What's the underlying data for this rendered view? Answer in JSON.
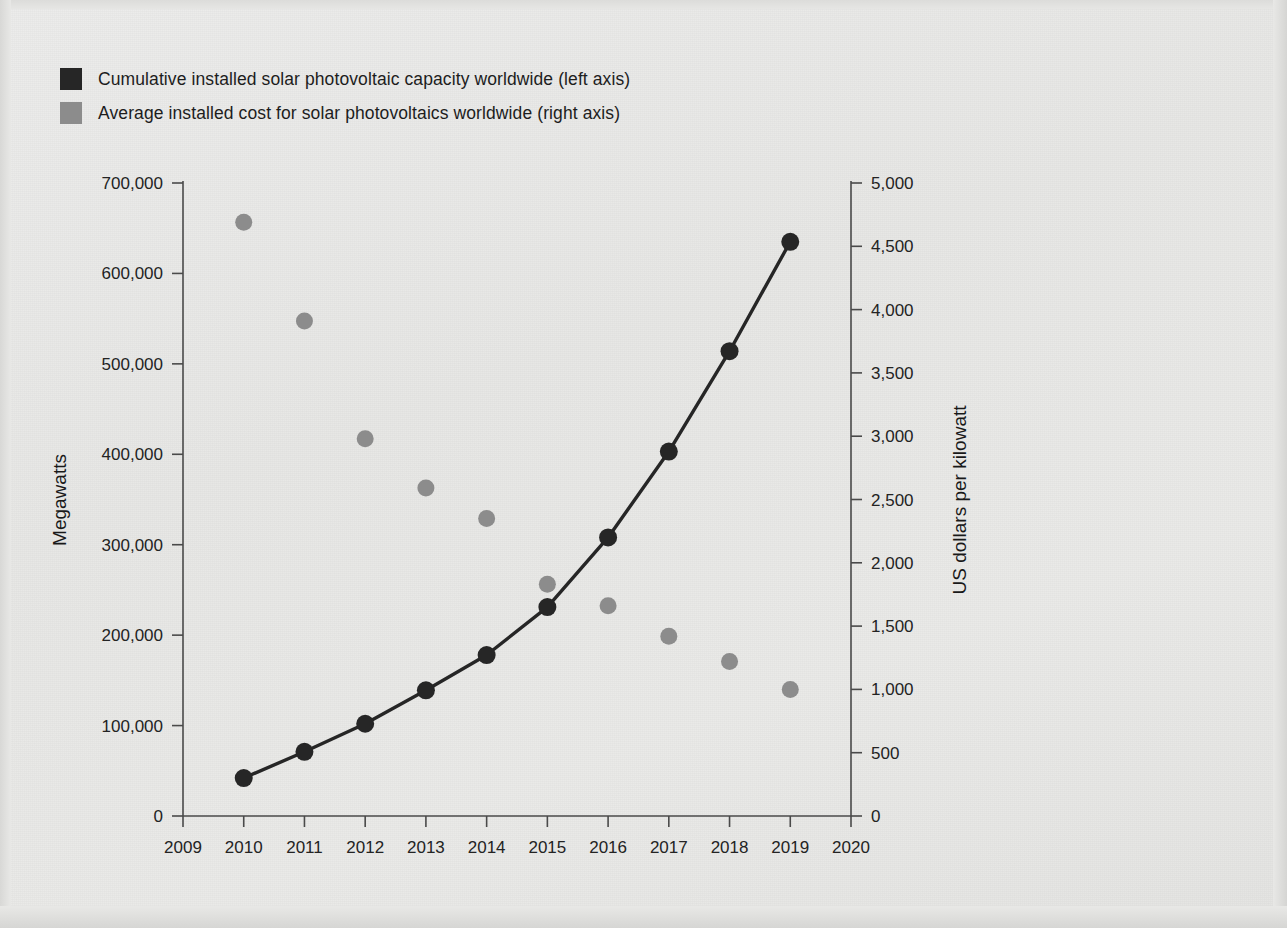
{
  "legend": {
    "items": [
      {
        "label": "Cumulative installed solar photovoltaic capacity worldwide (left axis)",
        "color": "#262626",
        "swatch": "legend-swatch-dark"
      },
      {
        "label": "Average installed cost for solar photovoltaics worldwide (right axis)",
        "color": "#8c8c8c",
        "swatch": "legend-swatch-gray"
      }
    ]
  },
  "chart_data": {
    "type": "scatter",
    "title": "",
    "xlabel": "",
    "ylabel": "Megawatts",
    "y2label": "US dollars per kilowatt",
    "grid": false,
    "legend_position": "top-left",
    "x": [
      2010,
      2011,
      2012,
      2013,
      2014,
      2015,
      2016,
      2017,
      2018,
      2019
    ],
    "xlim": [
      2009,
      2020
    ],
    "xticks": [
      "2009",
      "2010",
      "2011",
      "2012",
      "2013",
      "2014",
      "2015",
      "2016",
      "2017",
      "2018",
      "2019",
      "2020"
    ],
    "ylim": [
      0,
      700000
    ],
    "yticks": [
      "0",
      "100,000",
      "200,000",
      "300,000",
      "400,000",
      "500,000",
      "600,000",
      "700,000"
    ],
    "y2lim": [
      0,
      5000
    ],
    "y2ticks": [
      "0",
      "500",
      "1,000",
      "1,500",
      "2,000",
      "2,500",
      "3,000",
      "3,500",
      "4,000",
      "4,500",
      "5,000"
    ],
    "series": [
      {
        "name": "Cumulative installed solar photovoltaic capacity worldwide (left axis)",
        "axis": "left",
        "unit": "Megawatts",
        "color": "#262626",
        "marker": "circle",
        "line": true,
        "values": [
          42000,
          71000,
          102000,
          139000,
          178000,
          231000,
          308000,
          403000,
          514000,
          635000
        ]
      },
      {
        "name": "Average installed cost for solar photovoltaics worldwide (right axis)",
        "axis": "right",
        "unit": "US dollars per kilowatt",
        "color": "#8c8c8c",
        "marker": "circle",
        "line": false,
        "values": [
          4690,
          3910,
          2980,
          2590,
          2350,
          1830,
          1660,
          1420,
          1220,
          1000
        ]
      }
    ]
  }
}
